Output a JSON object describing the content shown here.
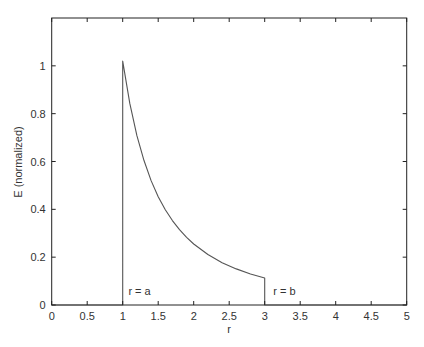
{
  "chart_data": {
    "type": "line",
    "title": "",
    "xlabel": "r",
    "ylabel": "E (normalized)",
    "xlim": [
      0,
      5
    ],
    "ylim": [
      0,
      1.2
    ],
    "grid": false,
    "legend": null,
    "x_ticks": [
      0,
      0.5,
      1,
      1.5,
      2,
      2.5,
      3,
      3.5,
      4,
      4.5,
      5
    ],
    "x_tick_labels": [
      "0",
      "0.5",
      "1",
      "1.5",
      "2",
      "2.5",
      "3",
      "3.5",
      "4",
      "4.5",
      "5"
    ],
    "y_ticks": [
      0,
      0.2,
      0.4,
      0.6,
      0.8,
      1.0
    ],
    "y_tick_labels": [
      "0",
      "0.2",
      "0.4",
      "0.6",
      "0.8",
      "1"
    ],
    "series": [
      {
        "name": "E(r)",
        "description": "Zero for r<a, jumps to ~1.02 at r=a, decays as 1/r^2 to ~0.113 at r=b, then drops to zero",
        "x": [
          0,
          1,
          1,
          1.1,
          1.2,
          1.3,
          1.4,
          1.5,
          1.6,
          1.7,
          1.8,
          1.9,
          2.0,
          2.2,
          2.4,
          2.6,
          2.8,
          3.0,
          3.0,
          5
        ],
        "y": [
          0,
          0,
          1.02,
          0.843,
          0.708,
          0.604,
          0.52,
          0.453,
          0.398,
          0.353,
          0.315,
          0.283,
          0.255,
          0.211,
          0.177,
          0.151,
          0.13,
          0.113,
          0,
          0
        ]
      }
    ],
    "annotations": [
      {
        "text": "r = a",
        "x": 1.08,
        "y": 0.04
      },
      {
        "text": "r = b",
        "x": 3.12,
        "y": 0.04
      }
    ],
    "colors": {
      "axis": "#222222",
      "curve": "#555555",
      "text": "#333333"
    }
  }
}
